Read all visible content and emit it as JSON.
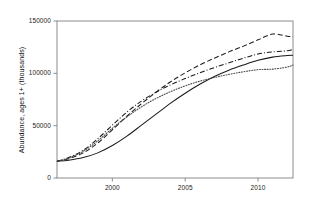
{
  "chart_data": {
    "type": "line",
    "title": "",
    "xlabel": "",
    "ylabel": "Abundance, ages 1+ (thousands)",
    "xlim": [
      1996.2,
      2012.4
    ],
    "ylim": [
      0,
      150000
    ],
    "grid": false,
    "legend": "none",
    "xticks": [
      2000,
      2005,
      2010
    ],
    "xtick_labels": [
      "2000",
      "2005",
      "2010"
    ],
    "yticks": [
      0,
      50000,
      100000,
      150000
    ],
    "ytick_labels": [
      "0",
      "50000",
      "100000",
      "150000"
    ],
    "series": [
      {
        "name": "Series 1",
        "style": "solid",
        "color": "#1a1a1a",
        "x": [
          1996.2,
          1997,
          1998,
          1999,
          2000,
          2001,
          2002,
          2003,
          2004,
          2005,
          2006,
          2007,
          2008,
          2009,
          2010,
          2011,
          2012,
          2012.4
        ],
        "values": [
          16000,
          17000,
          19500,
          24000,
          31000,
          40000,
          50500,
          61000,
          71500,
          81000,
          89500,
          97000,
          103000,
          108000,
          112500,
          115500,
          117000,
          117300
        ]
      },
      {
        "name": "Series 2",
        "style": "dashed",
        "color": "#1a1a1a",
        "x": [
          1996.2,
          1997,
          1998,
          1999,
          2000,
          2001,
          2002,
          2003,
          2004,
          2005,
          2006,
          2007,
          2008,
          2009,
          2010,
          2011,
          2012,
          2012.4
        ],
        "values": [
          16000,
          18500,
          24000,
          33500,
          46000,
          59000,
          71000,
          82000,
          92000,
          100500,
          108000,
          114500,
          120500,
          126000,
          132000,
          137500,
          135500,
          135000
        ]
      },
      {
        "name": "Series 3",
        "style": "dashdot",
        "color": "#1a1a1a",
        "x": [
          1996.2,
          1997,
          1998,
          1999,
          2000,
          2001,
          2002,
          2003,
          2004,
          2005,
          2006,
          2007,
          2008,
          2009,
          2010,
          2011,
          2012,
          2012.4
        ],
        "values": [
          16000,
          19500,
          26500,
          37500,
          50500,
          63000,
          73500,
          82000,
          89000,
          95000,
          100500,
          105500,
          110000,
          114500,
          118500,
          120500,
          121500,
          123000
        ]
      },
      {
        "name": "Series 4",
        "style": "dotted",
        "color": "#4d4d4d",
        "x": [
          1996.2,
          1997,
          1998,
          1999,
          2000,
          2001,
          2002,
          2003,
          2004,
          2005,
          2006,
          2007,
          2008,
          2009,
          2010,
          2011,
          2012,
          2012.4
        ],
        "values": [
          16000,
          19000,
          25500,
          35500,
          47500,
          58500,
          68000,
          76000,
          82500,
          88000,
          92500,
          96000,
          99000,
          101500,
          103500,
          104000,
          106000,
          108000
        ]
      }
    ]
  },
  "axes": {
    "plot_left_px": 57,
    "plot_right_px": 293,
    "plot_top_px": 21,
    "plot_bottom_px": 178
  }
}
